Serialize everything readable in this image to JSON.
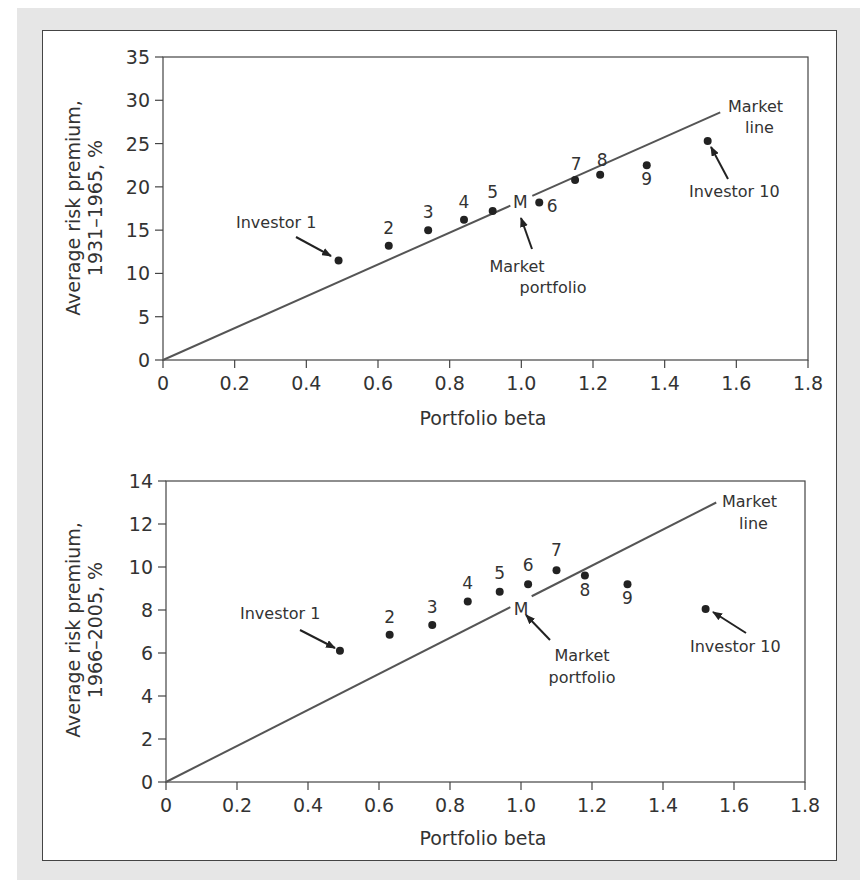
{
  "chart_data": [
    {
      "type": "scatter",
      "title": "",
      "xlabel": "Portfolio beta",
      "ylabel": "Average risk premium, 1931–1965, %",
      "ylabel_lines": [
        "Average risk premium,",
        "1931–1965, %"
      ],
      "xlim": [
        0,
        1.8
      ],
      "ylim": [
        0,
        35
      ],
      "x_ticks": [
        "0",
        "0.2",
        "0.4",
        "0.6",
        "0.8",
        "1.0",
        "1.2",
        "1.4",
        "1.6",
        "1.8"
      ],
      "y_ticks": [
        "0",
        "5",
        "10",
        "15",
        "20",
        "25",
        "30",
        "35"
      ],
      "grid": false,
      "series": [
        {
          "name": "Investor portfolios",
          "labels": [
            "Investor 1",
            "2",
            "3",
            "4",
            "5",
            "6",
            "7",
            "8",
            "9",
            "Investor 10"
          ],
          "x": [
            0.49,
            0.63,
            0.74,
            0.84,
            0.92,
            1.05,
            1.15,
            1.22,
            1.35,
            1.52
          ],
          "y": [
            11.5,
            13.2,
            15.0,
            16.2,
            17.2,
            18.2,
            20.8,
            21.4,
            22.5,
            25.3
          ]
        },
        {
          "name": "Market line",
          "type": "line",
          "x": [
            0,
            1.555
          ],
          "y": [
            0,
            28.6
          ]
        }
      ],
      "market_portfolio": {
        "label": "M",
        "x": 1.0,
        "y": 18.2
      },
      "annotations": [
        "Market line",
        "Market portfolio",
        "Investor 1",
        "Investor 10"
      ]
    },
    {
      "type": "scatter",
      "title": "",
      "xlabel": "Portfolio beta",
      "ylabel": "Average risk premium, 1966–2005, %",
      "ylabel_lines": [
        "Average risk premium,",
        "1966–2005, %"
      ],
      "xlim": [
        0,
        1.8
      ],
      "ylim": [
        0,
        14
      ],
      "x_ticks": [
        "0",
        "0.2",
        "0.4",
        "0.6",
        "0.8",
        "1.0",
        "1.2",
        "1.4",
        "1.6",
        "1.8"
      ],
      "y_ticks": [
        "0",
        "2",
        "4",
        "6",
        "8",
        "10",
        "12",
        "14"
      ],
      "grid": false,
      "series": [
        {
          "name": "Investor portfolios",
          "labels": [
            "Investor 1",
            "2",
            "3",
            "4",
            "5",
            "6",
            "7",
            "8",
            "9",
            "Investor 10"
          ],
          "x": [
            0.49,
            0.63,
            0.75,
            0.85,
            0.94,
            1.02,
            1.1,
            1.18,
            1.3,
            1.52
          ],
          "y": [
            6.1,
            6.85,
            7.3,
            8.4,
            8.85,
            9.2,
            9.85,
            9.6,
            9.2,
            8.05
          ]
        },
        {
          "name": "Market line",
          "type": "line",
          "x": [
            0,
            1.55
          ],
          "y": [
            0,
            13.0
          ]
        }
      ],
      "market_portfolio": {
        "label": "M",
        "x": 1.0,
        "y": 8.4
      },
      "annotations": [
        "Market line",
        "Market portfolio",
        "Investor 1",
        "Investor 10"
      ]
    }
  ],
  "labels": {
    "market_line": [
      "Market",
      "line"
    ],
    "market_portfolio": [
      "Market",
      "portfolio"
    ],
    "m": "M",
    "investor_1": "Investor 1",
    "investor_10": "Investor 10"
  },
  "colors": {
    "ink": "#333333",
    "line": "#555555",
    "background": "#e6e6e6",
    "panel": "#ffffff"
  }
}
